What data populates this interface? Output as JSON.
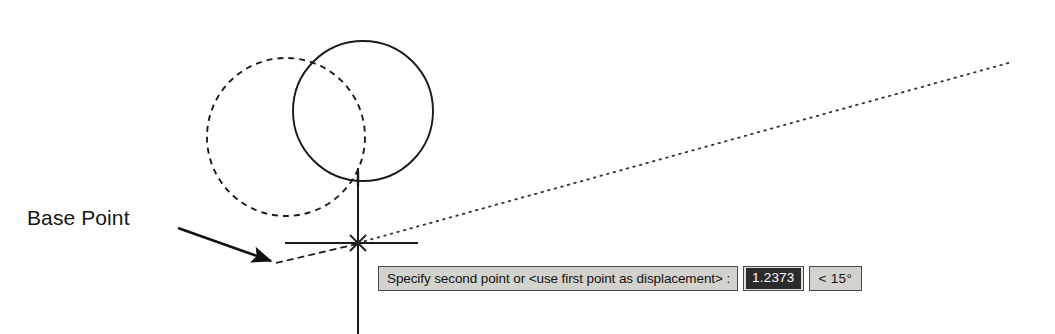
{
  "app": {
    "context": "cad-move-command-illustration"
  },
  "annotations": {
    "base_point_label": "Base Point"
  },
  "dynamic_input": {
    "prompt": "Specify second point or <use first point as displacement> :",
    "distance_value": "1.2373",
    "angle_value": "< 15°",
    "box_fill": "#d4d2cd",
    "box_border": "#4a4a4a",
    "value_highlight_bg": "#2b2b2b",
    "value_highlight_fg": "#ffffff"
  },
  "geometry": {
    "original_circle": {
      "name": "dashed-original-circle",
      "cx": 286,
      "cy": 137,
      "r": 79,
      "style": "dashed",
      "stroke": "#1a1a1a"
    },
    "moved_circle": {
      "name": "solid-moved-circle",
      "cx": 363,
      "cy": 111,
      "r": 70,
      "style": "solid",
      "stroke": "#1a1a1a"
    },
    "crosshair": {
      "cx": 358,
      "cy": 243,
      "vertical_top": 168,
      "vertical_bottom": 330,
      "horizontal_left": 285,
      "horizontal_right": 418,
      "stroke": "#1a1a1a"
    },
    "snap_marker": {
      "name": "osnap-x-marker",
      "cx": 358,
      "cy": 243,
      "size": 11
    },
    "tracking_line": {
      "name": "polar-tracking-vector",
      "x1": 358,
      "y1": 243,
      "x2": 1012,
      "y2": 62,
      "style": "dotted",
      "stroke": "#333333"
    },
    "displacement_line": {
      "name": "displacement-dashed-vector",
      "x1": 275,
      "y1": 262,
      "x2": 358,
      "y2": 243,
      "style": "dashed"
    },
    "leader": {
      "name": "base-point-leader-arrow",
      "x1": 178,
      "y1": 228,
      "x2": 275,
      "y2": 263
    }
  }
}
